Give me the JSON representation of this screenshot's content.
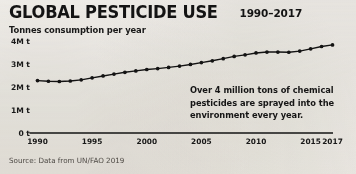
{
  "header": {
    "title": "GLOBAL PESTICIDE USE",
    "range": "1990–2017",
    "subtitle": "Tonnes consumption per year"
  },
  "annotation": {
    "text": "Over 4 million tons of chemical pesticides are sprayed into the environment every year."
  },
  "source": {
    "text": "Source: Data from UN/FAO 2019"
  },
  "colors": {
    "background": "#f4f2ee",
    "ink": "#1a1a1a",
    "line": "#141414",
    "axis": "#141414",
    "source_text": "#55514c"
  },
  "chart_data": {
    "type": "line",
    "title": "GLOBAL PESTICIDE USE",
    "subtitle": "Tonnes consumption per year",
    "xlabel": "",
    "ylabel": "Tonnes consumption per year",
    "xlim": [
      1990,
      2017
    ],
    "ylim": [
      0,
      4000000
    ],
    "grid": false,
    "legend": "none",
    "marker": "circle",
    "y_ticks": [
      0,
      1000000,
      2000000,
      3000000,
      4000000
    ],
    "y_tick_labels": [
      "0 t",
      "1M t",
      "2M t",
      "3M t",
      "4M t"
    ],
    "x_ticks": [
      1990,
      1995,
      2000,
      2005,
      2010,
      2015,
      2017
    ],
    "x_tick_labels": [
      "1990",
      "1995",
      "2000",
      "2005",
      "2010",
      "2015",
      "2017"
    ],
    "units": "tonnes per year",
    "x": [
      1990,
      1991,
      1992,
      1993,
      1994,
      1995,
      1996,
      1997,
      1998,
      1999,
      2000,
      2001,
      2002,
      2003,
      2004,
      2005,
      2006,
      2007,
      2008,
      2009,
      2010,
      2011,
      2012,
      2013,
      2014,
      2015,
      2016,
      2017
    ],
    "values": [
      2280000,
      2250000,
      2240000,
      2260000,
      2310000,
      2400000,
      2480000,
      2560000,
      2640000,
      2700000,
      2760000,
      2800000,
      2850000,
      2910000,
      2980000,
      3060000,
      3140000,
      3230000,
      3330000,
      3400000,
      3480000,
      3520000,
      3520000,
      3510000,
      3560000,
      3660000,
      3760000,
      3830000
    ]
  }
}
